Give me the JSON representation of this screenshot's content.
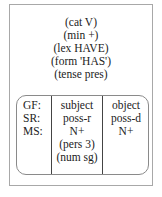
{
  "head": {
    "features": [
      "(cat V)",
      "(min +)",
      "(lex HAVE)",
      "(form 'HAS')",
      "(tense pres)"
    ]
  },
  "table": {
    "labels": [
      "GF:",
      "SR:",
      "MS:"
    ],
    "columns": [
      {
        "lines": [
          "subject",
          "poss-r",
          "N+",
          "(pers 3)",
          "(num sg)"
        ]
      },
      {
        "lines": [
          "object",
          "poss-d",
          "N+"
        ]
      }
    ]
  }
}
